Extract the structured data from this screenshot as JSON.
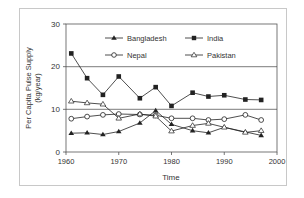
{
  "chart_data": {
    "type": "line",
    "title": "",
    "xlabel": "Time",
    "ylabel": "Per Capita Pulse Supply",
    "ylabel_units": "(kg/year)",
    "xlim": [
      1960,
      2000
    ],
    "ylim": [
      0,
      30
    ],
    "x_ticks": [
      "1960",
      "1970",
      "1980",
      "1990",
      "2000"
    ],
    "y_ticks": [
      "0",
      "10",
      "20",
      "30"
    ],
    "grid": "horizontal lines at 10 and 20",
    "legend_position": "top inside plot",
    "x": [
      1961,
      1964,
      1967,
      1970,
      1974,
      1977,
      1980,
      1984,
      1987,
      1990,
      1994,
      1997
    ],
    "series": [
      {
        "name": "Bangladesh",
        "marker": "filled-triangle",
        "values": [
          4.4,
          4.5,
          4.1,
          4.8,
          6.8,
          9.7,
          6.5,
          5.0,
          4.5,
          5.8,
          4.7,
          3.9
        ]
      },
      {
        "name": "India",
        "marker": "filled-square",
        "values": [
          23.1,
          17.3,
          13.4,
          17.7,
          12.6,
          15.2,
          10.8,
          13.9,
          13.0,
          13.3,
          12.3,
          12.2
        ]
      },
      {
        "name": "Nepal",
        "marker": "open-circle",
        "values": [
          7.8,
          8.3,
          8.7,
          8.9,
          8.8,
          8.6,
          7.9,
          7.9,
          7.5,
          7.7,
          8.7,
          7.5
        ]
      },
      {
        "name": "Pakistan",
        "marker": "open-triangle",
        "values": [
          11.9,
          11.5,
          11.2,
          7.9,
          8.9,
          8.4,
          4.9,
          6.2,
          6.7,
          5.8,
          4.6,
          5.0
        ]
      }
    ]
  },
  "legend": {
    "items": [
      {
        "label": "Bangladesh"
      },
      {
        "label": "India"
      },
      {
        "label": "Nepal"
      },
      {
        "label": "Pakistan"
      }
    ]
  },
  "axes": {
    "xlabel": "Time",
    "ylabel_line1": "Per Capita Pulse Supply",
    "ylabel_line2": "(kg/year)",
    "x_ticks": [
      "1960",
      "1970",
      "1980",
      "1990",
      "2000"
    ],
    "y_ticks": [
      "0",
      "10",
      "20",
      "30"
    ]
  }
}
